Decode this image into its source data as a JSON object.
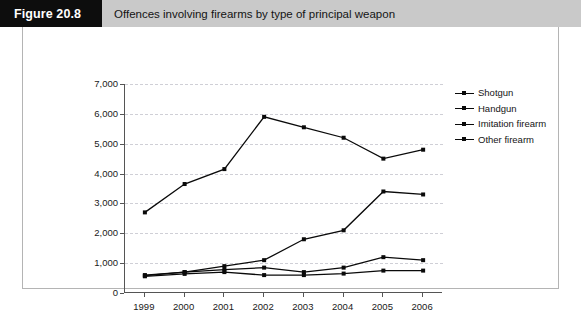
{
  "figure": {
    "tag": "Figure 20.8",
    "caption": "Offences involving firearms by type of principal weapon"
  },
  "chart_data": {
    "type": "line",
    "title": "Offences involving firearms by type of principal weapon",
    "xlabel": "",
    "ylabel": "",
    "categories": [
      "1999",
      "2000",
      "2001",
      "2002",
      "2003",
      "2004",
      "2005",
      "2006"
    ],
    "ylim": [
      0,
      7000
    ],
    "ytick_step": 1000,
    "ytick_labels": [
      "0",
      "1,000",
      "2,000",
      "3,000",
      "4,000",
      "5,000",
      "6,000",
      "7,000"
    ],
    "grid": true,
    "grid_style": "dashed-horizontal",
    "legend_position": "right",
    "series": [
      {
        "name": "Shotgun",
        "values": [
          600,
          700,
          780,
          850,
          700,
          850,
          1200,
          1100
        ]
      },
      {
        "name": "Handgun",
        "values": [
          2700,
          3650,
          4150,
          5900,
          5550,
          5200,
          4500,
          4800
        ]
      },
      {
        "name": "Imitation firearm",
        "values": [
          580,
          700,
          900,
          1100,
          1800,
          2100,
          3400,
          3300
        ]
      },
      {
        "name": "Other firearm",
        "values": [
          560,
          640,
          700,
          600,
          600,
          650,
          750,
          750
        ]
      }
    ],
    "line_color": "#0a0a0a",
    "marker": "square"
  }
}
